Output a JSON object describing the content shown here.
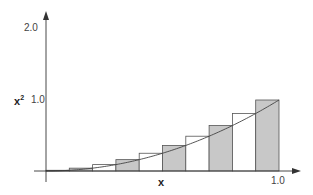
{
  "chart_data": {
    "type": "bar",
    "title": "",
    "xlabel": "x",
    "ylabel": "x²",
    "ylabel_base": "x",
    "ylabel_exp": "2",
    "xlim": [
      0,
      1.0
    ],
    "ylim": [
      0,
      2.0
    ],
    "x_tick_labels": [
      "1.0"
    ],
    "y_tick_labels": [
      "1.0",
      "2.0"
    ],
    "grid": false,
    "legend": null,
    "curve": {
      "function": "y = x^2",
      "domain": [
        0,
        1.0
      ]
    },
    "bar_width": 0.1,
    "bars": [
      {
        "x_start": 0.0,
        "x_end": 0.1,
        "height": 0.01,
        "fill": "grey"
      },
      {
        "x_start": 0.1,
        "x_end": 0.2,
        "height": 0.04,
        "fill": "grey"
      },
      {
        "x_start": 0.2,
        "x_end": 0.3,
        "height": 0.09,
        "fill": "white"
      },
      {
        "x_start": 0.3,
        "x_end": 0.4,
        "height": 0.16,
        "fill": "grey"
      },
      {
        "x_start": 0.4,
        "x_end": 0.5,
        "height": 0.25,
        "fill": "white"
      },
      {
        "x_start": 0.5,
        "x_end": 0.6,
        "height": 0.36,
        "fill": "grey"
      },
      {
        "x_start": 0.6,
        "x_end": 0.7,
        "height": 0.49,
        "fill": "white"
      },
      {
        "x_start": 0.7,
        "x_end": 0.8,
        "height": 0.64,
        "fill": "grey"
      },
      {
        "x_start": 0.8,
        "x_end": 0.9,
        "height": 0.81,
        "fill": "white"
      },
      {
        "x_start": 0.9,
        "x_end": 1.0,
        "height": 1.0,
        "fill": "grey"
      }
    ],
    "categories": [
      "0.1",
      "0.2",
      "0.3",
      "0.4",
      "0.5",
      "0.6",
      "0.7",
      "0.8",
      "0.9",
      "1.0"
    ],
    "values": [
      0.01,
      0.04,
      0.09,
      0.16,
      0.25,
      0.36,
      0.49,
      0.64,
      0.81,
      1.0
    ],
    "colors": {
      "grey_fill": "#c8c8c8",
      "white_fill": "#ffffff",
      "stroke": "#555555",
      "axis": "#333333"
    }
  }
}
